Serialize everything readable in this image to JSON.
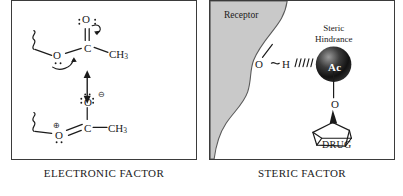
{
  "figure": {
    "panels": [
      {
        "id": "electronic",
        "caption": "ELECTRONIC FACTOR",
        "structures": {
          "top": {
            "name": "ester-resonance-neutral",
            "atoms": [
              {
                "name": "carbonyl-oxygen",
                "label": "O"
              },
              {
                "name": "ester-oxygen",
                "label": "O"
              },
              {
                "name": "carbonyl-carbon",
                "label": "C"
              },
              {
                "name": "methyl-group",
                "label": "CH",
                "subscript": "3"
              }
            ],
            "annotations": [
              "lone-pair-dots",
              "curved-arrow-to-oxygen",
              "curved-arrow-from-ester-oxygen",
              "wavy-bond"
            ]
          },
          "bottom": {
            "name": "ester-resonance-charged",
            "atoms": [
              {
                "name": "alkoxide-oxygen",
                "label": "O",
                "charge": "⊖"
              },
              {
                "name": "oxocarbenium-oxygen",
                "label": "O",
                "charge": "⊕"
              },
              {
                "name": "carbonyl-carbon",
                "label": "C"
              },
              {
                "name": "methyl-group",
                "label": "CH",
                "subscript": "3"
              }
            ],
            "annotations": [
              "lone-pair-dots",
              "wavy-bond",
              "double-bond"
            ]
          },
          "resonance_arrow": {
            "name": "resonance-double-arrow",
            "direction": "vertical"
          }
        }
      },
      {
        "id": "steric",
        "caption": "STERIC FACTOR",
        "labels": {
          "receptor": "Receptor",
          "steric_hindrance": "Steric\nHindrance",
          "drug": "DRUG",
          "hydroxyl_oxygen": "O",
          "hydroxyl_hydrogen": "H",
          "linking_oxygen": "O",
          "acetyl_sphere": "Ac"
        },
        "annotations": [
          "hydrogen-bond-hatching",
          "receptor-surface-shading",
          "wedge-bond",
          "cyclopentane-ring"
        ]
      }
    ]
  },
  "colors": {
    "border": "#3b3b3b",
    "ink": "#1b1b1b",
    "receptor_fill": "#c9c9c9",
    "sphere_dark": "#111111",
    "sphere_light": "#8e8e8e",
    "background": "#ffffff"
  }
}
